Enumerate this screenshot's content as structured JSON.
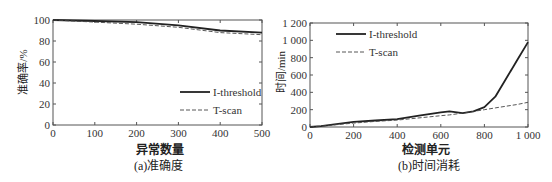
{
  "chart_data": [
    {
      "type": "line",
      "title": "",
      "caption": "(a)准确度",
      "xlabel": "异常数量",
      "ylabel": "准确率/%",
      "xlim": [
        0,
        500
      ],
      "ylim": [
        0,
        100
      ],
      "xticks": [
        "0",
        "100",
        "200",
        "300",
        "400",
        "500"
      ],
      "yticks": [
        "0",
        "20",
        "40",
        "60",
        "80",
        "100"
      ],
      "grid": false,
      "legend_position": "lower right",
      "x": [
        0,
        100,
        200,
        300,
        400,
        500
      ],
      "series": [
        {
          "name": "I-threshold",
          "style": "solid",
          "values": [
            100,
            99,
            98,
            95,
            90,
            88
          ]
        },
        {
          "name": "T-scan",
          "style": "dashed",
          "values": [
            100,
            98,
            96,
            93,
            88,
            86
          ]
        }
      ]
    },
    {
      "type": "line",
      "title": "",
      "caption": "(b)时间消耗",
      "xlabel": "检测单元",
      "ylabel": "时间/min",
      "xlim": [
        0,
        1000
      ],
      "ylim": [
        0,
        1200
      ],
      "xticks": [
        "0",
        "200",
        "400",
        "600",
        "800",
        "1 000"
      ],
      "yticks": [
        "0",
        "200",
        "400",
        "600",
        "800",
        "1 000",
        "1 200"
      ],
      "grid": false,
      "legend_position": "upper left",
      "x": [
        0,
        50,
        200,
        300,
        400,
        500,
        600,
        640,
        700,
        750,
        800,
        850,
        900,
        950,
        1000
      ],
      "series": [
        {
          "name": "I-threshold",
          "style": "solid",
          "values": [
            0,
            10,
            60,
            75,
            90,
            130,
            170,
            180,
            160,
            180,
            230,
            350,
            560,
            770,
            980
          ]
        },
        {
          "name": "T-scan",
          "style": "dashed",
          "values": [
            0,
            10,
            45,
            65,
            80,
            105,
            130,
            140,
            160,
            180,
            200,
            220,
            240,
            260,
            285
          ]
        }
      ]
    }
  ],
  "panels": {
    "a": {
      "caption": "(a)准确度",
      "xlabel": "异常数量",
      "ylabel": "准确率/%",
      "legend": [
        "I-threshold",
        "T-scan"
      ]
    },
    "b": {
      "caption": "(b)时间消耗",
      "xlabel": "检测单元",
      "ylabel": "时间/min",
      "legend": [
        "I-threshold",
        "T-scan"
      ]
    }
  }
}
